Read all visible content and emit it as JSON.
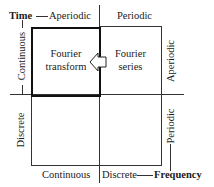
{
  "diagram": {
    "top_axis": {
      "label": "Time",
      "left_column": "Aperiodic",
      "right_column": "Periodic"
    },
    "left_axis": {
      "top_row": "Continuous",
      "bottom_row": "Discrete"
    },
    "right_axis": {
      "top_row": "Aperiodic",
      "bottom_row": "Periodic"
    },
    "bottom_axis": {
      "label": "Frequency",
      "left_column": "Continuous",
      "right_column": "Discrete"
    },
    "cells": {
      "top_left": {
        "line1": "Fourier",
        "line2": "transform",
        "highlighted": true
      },
      "top_right": {
        "line1": "Fourier",
        "line2": "series"
      },
      "bottom_left": {},
      "bottom_right": {}
    },
    "arrow": {
      "from": "top_right",
      "to": "top_left",
      "style": "hollow-left-arrow"
    }
  }
}
